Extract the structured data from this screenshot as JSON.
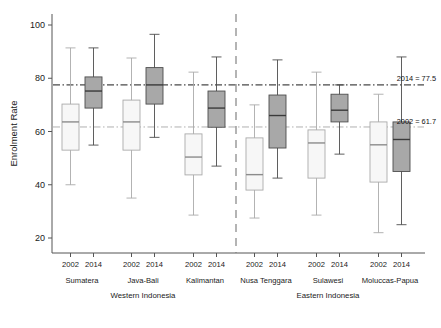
{
  "chart_data": {
    "type": "box",
    "title": "",
    "subtitle": "",
    "xlabel": "",
    "ylabel": "Enrolment Rate",
    "ylim": [
      14,
      104
    ],
    "yticks": [
      20,
      40,
      60,
      80,
      100
    ],
    "ytick_labels": [
      "20",
      "40",
      "60",
      "80",
      "100"
    ],
    "grid": false,
    "legend_position": "none",
    "series_labels": [
      "2002",
      "2014"
    ],
    "series_colors": {
      "2002": "#f7f7f7",
      "2014": "#a8a8a8"
    },
    "reference_lines": [
      {
        "label": "2014 = 77.5",
        "value": 77.5,
        "style": "dash-dot",
        "color": "#1a1a1a"
      },
      {
        "label": "2002 = 61.7",
        "value": 61.7,
        "style": "dash-dot",
        "color": "#b0b0b0"
      }
    ],
    "super_groups": [
      {
        "label": "Western Indonesia",
        "groups": [
          "Sumatera",
          "Java-Bali",
          "Kalimantan"
        ]
      },
      {
        "label": "Eastern Indonesia",
        "groups": [
          "Nusa Tenggara",
          "Sulawesi",
          "Moluccas-Papua"
        ]
      }
    ],
    "categories": [
      "Sumatera",
      "Java-Bali",
      "Kalimantan",
      "Nusa Tenggara",
      "Sulawesi",
      "Moluccas-Papua"
    ],
    "boxes": [
      {
        "group": "Sumatera",
        "year": "2002",
        "whisker_low": 40.0,
        "q1": 53.0,
        "median": 63.6,
        "q3": 70.3,
        "whisker_high": 91.4
      },
      {
        "group": "Sumatera",
        "year": "2014",
        "whisker_low": 54.9,
        "q1": 68.8,
        "median": 75.2,
        "q3": 80.5,
        "whisker_high": 91.4
      },
      {
        "group": "Java-Bali",
        "year": "2002",
        "whisker_low": 35.0,
        "q1": 53.0,
        "median": 63.6,
        "q3": 71.8,
        "whisker_high": 87.6
      },
      {
        "group": "Java-Bali",
        "year": "2014",
        "whisker_low": 57.8,
        "q1": 70.3,
        "median": 77.5,
        "q3": 84.0,
        "whisker_high": 96.5
      },
      {
        "group": "Kalimantan",
        "year": "2002",
        "whisker_low": 28.6,
        "q1": 43.7,
        "median": 50.4,
        "q3": 59.1,
        "whisker_high": 82.3
      },
      {
        "group": "Kalimantan",
        "year": "2014",
        "whisker_low": 47.0,
        "q1": 61.6,
        "median": 68.8,
        "q3": 75.2,
        "whisker_high": 88.0
      },
      {
        "group": "Nusa Tenggara",
        "year": "2002",
        "whisker_low": 27.5,
        "q1": 38.0,
        "median": 43.8,
        "q3": 57.6,
        "whisker_high": 70.0
      },
      {
        "group": "Nusa Tenggara",
        "year": "2014",
        "whisker_low": 42.5,
        "q1": 53.8,
        "median": 66.0,
        "q3": 73.7,
        "whisker_high": 86.9
      },
      {
        "group": "Sulawesi",
        "year": "2002",
        "whisker_low": 28.6,
        "q1": 42.5,
        "median": 55.7,
        "q3": 60.6,
        "whisker_high": 82.3
      },
      {
        "group": "Sulawesi",
        "year": "2014",
        "whisker_low": 51.5,
        "q1": 63.6,
        "median": 68.0,
        "q3": 74.0,
        "whisker_high": 77.5
      },
      {
        "group": "Moluccas-Papua",
        "year": "2002",
        "whisker_low": 22.0,
        "q1": 41.0,
        "median": 55.0,
        "q3": 63.6,
        "whisker_high": 74.0
      },
      {
        "group": "Moluccas-Papua",
        "year": "2014",
        "whisker_low": 25.0,
        "q1": 45.0,
        "median": 57.0,
        "q3": 63.6,
        "whisker_high": 88.0
      }
    ]
  },
  "axis": {
    "ylabel": "Enrolment Rate",
    "ytick_labels": [
      "100",
      "80",
      "60",
      "40",
      "20"
    ]
  },
  "xaxis": {
    "year_ticks": [
      "2002",
      "2014",
      "2002",
      "2014",
      "2002",
      "2014",
      "2002",
      "2014",
      "2002",
      "2014",
      "2002",
      "2014"
    ],
    "group_labels": [
      "Sumatera",
      "Java-Bali",
      "Kalimantan",
      "Nusa Tenggara",
      "Sulawesi",
      "Moluccas-Papua"
    ],
    "super_labels": [
      "Western Indonesia",
      "Eastern Indonesia"
    ]
  },
  "annotations": [
    {
      "text": "2014 = 77.5"
    },
    {
      "text": "2002 = 61.7"
    }
  ]
}
